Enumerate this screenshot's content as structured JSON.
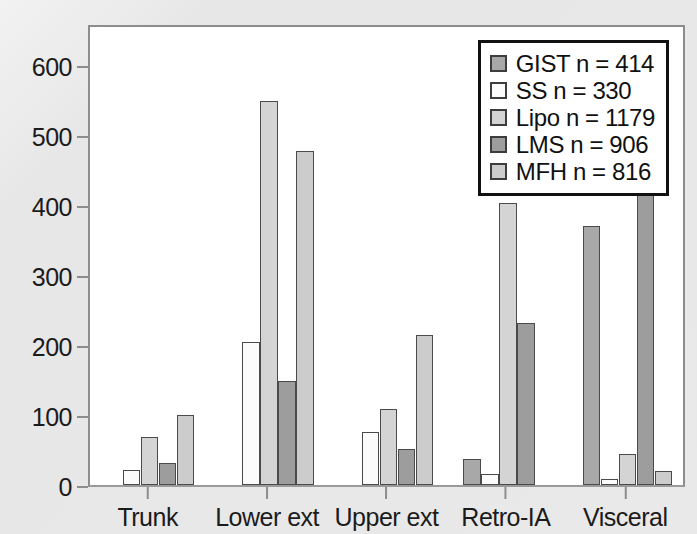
{
  "chart_data": {
    "type": "bar",
    "title": "",
    "subtitle": "",
    "xlabel": "",
    "ylabel": "",
    "categories": [
      "Trunk",
      "Lower ext",
      "Upper ext",
      "Retro-IA",
      "Visceral"
    ],
    "ylim": [
      0,
      660
    ],
    "yticks": [
      0,
      100,
      200,
      300,
      400,
      500,
      600
    ],
    "ytick_labels": [
      "0",
      "100",
      "200",
      "300",
      "400",
      "500",
      "600"
    ],
    "grid": false,
    "legend_position": "top-right",
    "series": [
      {
        "name": "GIST",
        "legend_label": "GIST n = 414",
        "n": 414,
        "color": "#a8a8a8",
        "values": [
          0,
          0,
          0,
          37,
          370
        ]
      },
      {
        "name": "SS",
        "legend_label": "SS n = 330",
        "n": 330,
        "color": "#fbfbfb",
        "values": [
          22,
          204,
          76,
          16,
          9
        ]
      },
      {
        "name": "Lipo",
        "legend_label": "Lipo n = 1179",
        "n": 1179,
        "color": "#d4d4d4",
        "values": [
          68,
          548,
          109,
          403,
          45
        ]
      },
      {
        "name": "LMS",
        "legend_label": "LMS n = 906",
        "n": 906,
        "color": "#9d9d9d",
        "values": [
          32,
          148,
          52,
          232,
          428
        ]
      },
      {
        "name": "MFH",
        "legend_label": "MFH n = 816",
        "n": 816,
        "color": "#cccccc",
        "values": [
          100,
          477,
          215,
          0,
          20
        ]
      }
    ]
  },
  "legend": {
    "items": [
      {
        "label": "GIST n = 414",
        "color": "#a8a8a8"
      },
      {
        "label": "SS n = 330",
        "color": "#fbfbfb"
      },
      {
        "label": "Lipo n = 1179",
        "color": "#d4d4d4"
      },
      {
        "label": "LMS n = 906",
        "color": "#9d9d9d"
      },
      {
        "label": "MFH n = 816",
        "color": "#cccccc"
      }
    ]
  },
  "colors": {
    "page_background": "#e9e9e9",
    "plot_background": "#ffffff",
    "frame": "#8d8d8d",
    "axis_text": "#1b1b1b",
    "bar_outline": "#4a4a4a",
    "legend_border": "#111111"
  }
}
